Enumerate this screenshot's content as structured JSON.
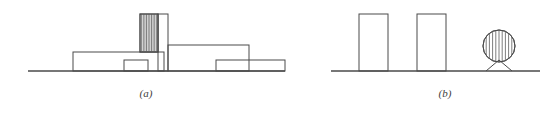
{
  "figure": {
    "background_color": "#ffffff",
    "line_color": "#4a4a4a",
    "hatch_color": "#6e6e6e",
    "label_color": "#3d3d3d",
    "panels": [
      {
        "id": "a",
        "label": "(a)",
        "label_x": 146,
        "label_y": 97,
        "description": "building elevation silhouette with hatched tower",
        "ground": {
          "x1": 28,
          "x2": 285,
          "y": 71
        },
        "shapes": [
          {
            "name": "left-low-block",
            "type": "rect",
            "x": 73,
            "y": 52,
            "w": 91,
            "h": 19,
            "hatched": false
          },
          {
            "name": "low-block-inner-box",
            "type": "rect",
            "x": 124,
            "y": 60,
            "w": 24,
            "h": 11,
            "hatched": false
          },
          {
            "name": "hatched-tower",
            "type": "rect",
            "x": 140,
            "y": 14,
            "w": 18,
            "h": 38,
            "hatched": true,
            "hatch_count": 10
          },
          {
            "name": "tower-shaft",
            "type": "rect",
            "x": 158,
            "y": 14,
            "w": 10,
            "h": 57,
            "hatched": false
          },
          {
            "name": "right-upper-block",
            "type": "rect",
            "x": 168,
            "y": 45,
            "w": 81,
            "h": 26,
            "hatched": false
          },
          {
            "name": "right-lower-step",
            "type": "rect",
            "x": 216,
            "y": 60,
            "w": 69,
            "h": 11,
            "hatched": false
          }
        ]
      },
      {
        "id": "b",
        "label": "(b)",
        "label_x": 445,
        "label_y": 97,
        "description": "two rectangular blocks and a hatched circle on splayed legs",
        "ground": {
          "x1": 331,
          "x2": 540,
          "y": 71
        },
        "shapes": [
          {
            "name": "left-tall-block",
            "type": "rect",
            "x": 359,
            "y": 14,
            "w": 29,
            "h": 57,
            "hatched": false
          },
          {
            "name": "right-tall-block",
            "type": "rect",
            "x": 417,
            "y": 14,
            "w": 29,
            "h": 57,
            "hatched": false
          },
          {
            "name": "hatched-circle",
            "type": "circle",
            "cx": 499,
            "cy": 46,
            "r": 16,
            "hatched": true,
            "hatch_count": 9
          },
          {
            "name": "circle-left-leg",
            "type": "line",
            "x1": 499,
            "y1": 60,
            "x2": 486,
            "y2": 71
          },
          {
            "name": "circle-right-leg",
            "type": "line",
            "x1": 499,
            "y1": 60,
            "x2": 512,
            "y2": 71
          }
        ]
      }
    ]
  }
}
